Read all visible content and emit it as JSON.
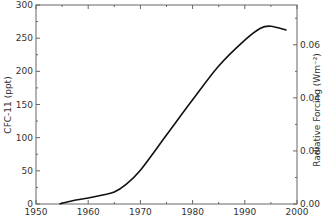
{
  "chart_data": {
    "type": "line",
    "title": "",
    "xlabel": "",
    "ylabel": "CFC-11 (ppt)",
    "y2label": "Radiative Forcing (Wm⁻²)",
    "xlim": [
      1950,
      2000
    ],
    "ylim": [
      0,
      300
    ],
    "y2lim": [
      0,
      0.075
    ],
    "x_ticks": [
      "1950",
      "1960",
      "1970",
      "1980",
      "1990",
      "2000"
    ],
    "y_ticks": [
      "0",
      "50",
      "100",
      "150",
      "200",
      "250",
      "300"
    ],
    "y2_ticks": [
      "0.00",
      "0.02",
      "0.04",
      "0.06"
    ],
    "grid": false,
    "legend": null,
    "series": [
      {
        "name": "CFC-11",
        "x": [
          1954.5,
          1957,
          1960,
          1963,
          1965,
          1967,
          1970,
          1975,
          1980,
          1985,
          1990,
          1993,
          1995,
          1998
        ],
        "values": [
          0,
          5,
          9,
          14,
          18,
          28,
          51,
          104,
          157,
          208,
          247,
          265,
          268,
          262
        ]
      }
    ]
  }
}
